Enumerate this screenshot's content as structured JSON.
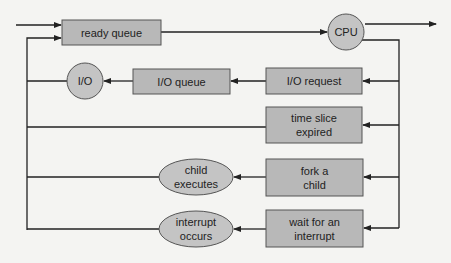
{
  "colors": {
    "background": "#f4f4f2",
    "box_fill": "#b8b8b8",
    "box_stroke": "#555555",
    "line": "#222222"
  },
  "nodes": {
    "ready_queue": {
      "label": "ready queue",
      "shape": "rect"
    },
    "cpu": {
      "label": "CPU",
      "shape": "circle"
    },
    "io_queue": {
      "label": "I/O queue",
      "shape": "rect"
    },
    "io": {
      "label": "I/O",
      "shape": "circle"
    },
    "io_request": {
      "label": "I/O request",
      "shape": "rect"
    },
    "time_slice": {
      "line1": "time slice",
      "line2": "expired",
      "shape": "rect"
    },
    "fork_child": {
      "line1": "fork a",
      "line2": "child",
      "shape": "rect"
    },
    "wait_interrupt": {
      "line1": "wait for an",
      "line2": "interrupt",
      "shape": "rect"
    },
    "child_executes": {
      "line1": "child",
      "line2": "executes",
      "shape": "ellipse"
    },
    "interrupt_occurs": {
      "line1": "interrupt",
      "line2": "occurs",
      "shape": "ellipse"
    }
  },
  "edges": [
    {
      "from": "entry",
      "to": "ready_queue"
    },
    {
      "from": "ready_queue",
      "to": "cpu"
    },
    {
      "from": "cpu",
      "to": "exit"
    },
    {
      "from": "cpu",
      "to": "io_request"
    },
    {
      "from": "cpu",
      "to": "time_slice"
    },
    {
      "from": "cpu",
      "to": "fork_child"
    },
    {
      "from": "cpu",
      "to": "wait_interrupt"
    },
    {
      "from": "io_request",
      "to": "io_queue"
    },
    {
      "from": "io_queue",
      "to": "io"
    },
    {
      "from": "io",
      "to": "ready_queue"
    },
    {
      "from": "time_slice",
      "to": "ready_queue"
    },
    {
      "from": "fork_child",
      "to": "child_executes"
    },
    {
      "from": "child_executes",
      "to": "ready_queue"
    },
    {
      "from": "wait_interrupt",
      "to": "interrupt_occurs"
    },
    {
      "from": "interrupt_occurs",
      "to": "ready_queue"
    }
  ]
}
